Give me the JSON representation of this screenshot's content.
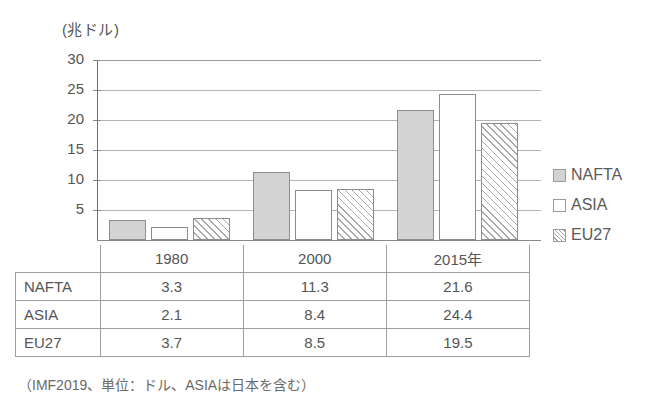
{
  "chart_data": {
    "type": "bar",
    "title": "",
    "unit_label": "(兆ドル)",
    "xlabel": "",
    "ylabel": "",
    "categories": [
      "1980",
      "2000",
      "2015年"
    ],
    "series": [
      {
        "name": "NAFTA",
        "values": [
          3.3,
          11.3,
          21.6
        ],
        "style": "solid-gray",
        "color": "#d3d3d3"
      },
      {
        "name": "ASIA",
        "values": [
          2.1,
          8.4,
          24.4
        ],
        "style": "white",
        "color": "#ffffff"
      },
      {
        "name": "EU27",
        "values": [
          3.7,
          8.5,
          19.5
        ],
        "style": "diagonal-hatch",
        "color": "#ffffff"
      }
    ],
    "ylim": [
      0,
      30
    ],
    "yticks": [
      30,
      25,
      20,
      15,
      10,
      5
    ],
    "ytick_labels": [
      "30",
      "25",
      "20",
      "15",
      "10",
      "5"
    ],
    "grid": true,
    "legend_position": "right"
  },
  "legend": {
    "items": [
      {
        "label": "NAFTA",
        "swatch": "nafta"
      },
      {
        "label": "ASIA",
        "swatch": "asia"
      },
      {
        "label": "EU27",
        "swatch": "eu27"
      }
    ]
  },
  "table": {
    "corner": "",
    "columns": [
      "1980",
      "2000",
      "2015年"
    ],
    "rows": [
      {
        "label": "NAFTA",
        "values": [
          "3.3",
          "11.3",
          "21.6"
        ]
      },
      {
        "label": "ASIA",
        "values": [
          "2.1",
          "8.4",
          "24.4"
        ]
      },
      {
        "label": "EU27",
        "values": [
          "3.7",
          "8.5",
          "19.5"
        ]
      }
    ]
  },
  "footnote": "（IMF2019、単位：ドル、ASIAは日本を含む）"
}
